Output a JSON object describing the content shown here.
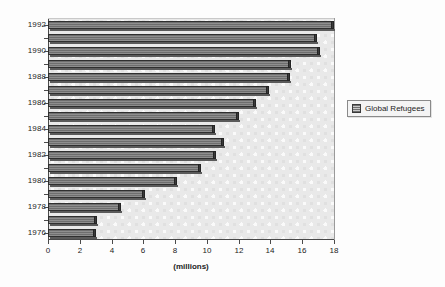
{
  "chart_data": {
    "type": "bar",
    "orientation": "horizontal",
    "title": "",
    "xlabel": "(millions)",
    "ylabel": "",
    "xlim": [
      0,
      18
    ],
    "ylim": [
      1975.5,
      1992.5
    ],
    "grid": false,
    "legend_position": "right",
    "series": [
      {
        "name": "Global Refugees",
        "categories": [
          1976,
          1977,
          1978,
          1979,
          1980,
          1981,
          1982,
          1983,
          1984,
          1985,
          1986,
          1987,
          1988,
          1989,
          1990,
          1991,
          1992
        ],
        "values": [
          3.0,
          3.1,
          4.6,
          6.1,
          8.1,
          9.6,
          10.6,
          11.1,
          10.5,
          12.0,
          13.1,
          13.9,
          15.2,
          15.3,
          17.1,
          16.9,
          18.0
        ]
      }
    ],
    "xticks": [
      0,
      2,
      4,
      6,
      8,
      10,
      12,
      14,
      16,
      18
    ],
    "xtick_labels": [
      "0",
      "2",
      "4",
      "6",
      "8",
      "10",
      "12",
      "14",
      "16",
      "18"
    ],
    "yticks": [
      1976,
      1978,
      1980,
      1982,
      1984,
      1986,
      1988,
      1990,
      1992
    ],
    "ytick_labels": [
      "1976",
      "1978",
      "1980",
      "1982",
      "1984",
      "1986",
      "1988",
      "1990",
      "1992"
    ],
    "colors": {
      "bar_fill": "#8e8e8e",
      "bar_edge": "#2f2f2f",
      "plot_background": "#e9e9e9",
      "axis": "#4a4a4a",
      "text": "#1c1c1c",
      "legend_background": "#f4f4f4",
      "figure_background": "#fdfdfd"
    }
  },
  "legend": {
    "entries": [
      {
        "label": "Global Refugees",
        "swatch": "legend-swatch-global-refugees"
      }
    ]
  },
  "axes": {
    "x_title": "(millions)"
  }
}
